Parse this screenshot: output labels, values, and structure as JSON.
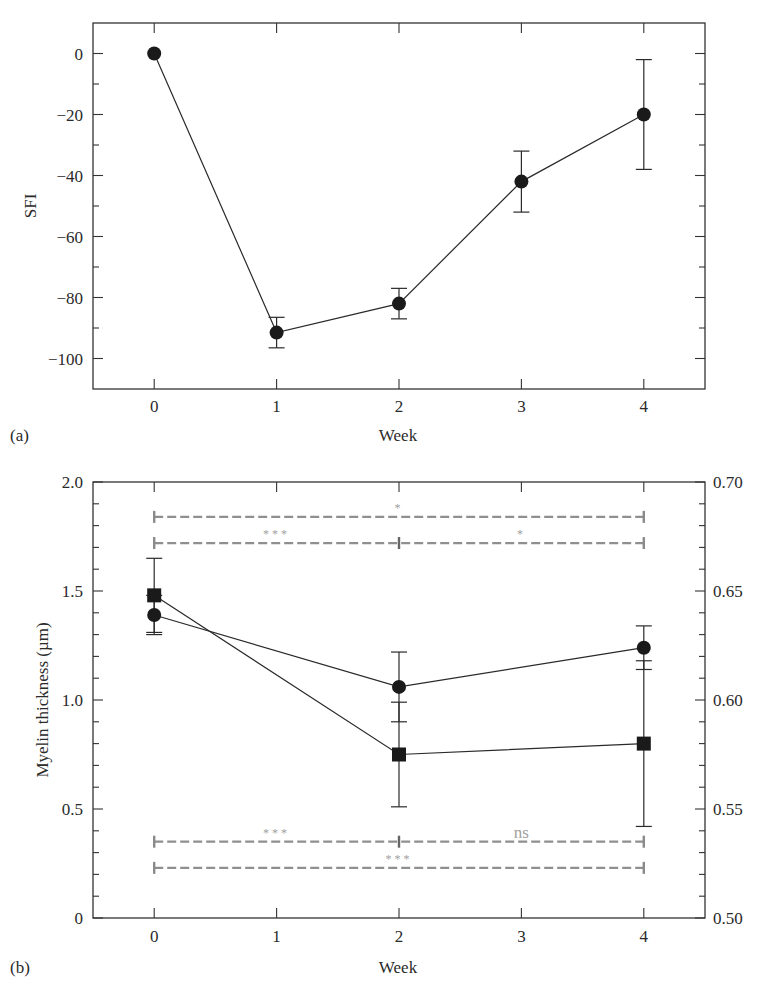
{
  "chart_data": [
    {
      "panel": "(a)",
      "type": "line",
      "title": "",
      "xlabel": "Week",
      "ylabel": "SFI",
      "x": [
        0,
        1,
        2,
        3,
        4
      ],
      "xlim": [
        -0.5,
        4.5
      ],
      "ylim": [
        -110,
        10
      ],
      "xticks": [
        0,
        1,
        2,
        3,
        4
      ],
      "yticks": [
        0,
        -20,
        -40,
        -60,
        -80,
        -100
      ],
      "grid": false,
      "legend": null,
      "series": [
        {
          "name": "SFI",
          "marker": "circle",
          "values": [
            0,
            -91.5,
            -82,
            -42,
            -20
          ],
          "error": [
            0,
            5,
            5,
            10,
            18
          ]
        }
      ]
    },
    {
      "panel": "(b)",
      "type": "line",
      "title": "",
      "xlabel": "Week",
      "ylabel": "Myelin thickness (µm)",
      "ylabel_right": "",
      "x": [
        0,
        2,
        4
      ],
      "xlim": [
        -0.5,
        4.5
      ],
      "ylim": [
        0,
        2.0
      ],
      "ylim_right": [
        0.5,
        0.7
      ],
      "xticks": [
        0,
        1,
        2,
        3,
        4
      ],
      "yticks": [
        "0",
        "0.5",
        "1.0",
        "1.5",
        "2.0"
      ],
      "yticks_right": [
        "0.50",
        "0.55",
        "0.60",
        "0.65",
        "0.70"
      ],
      "grid": false,
      "legend": null,
      "series": [
        {
          "name": "Myelin thickness",
          "marker": "circle",
          "axis": "left",
          "values": [
            1.39,
            1.06,
            1.24
          ],
          "error": [
            0.09,
            0.16,
            0.1
          ]
        },
        {
          "name": "Right-axis series",
          "marker": "square",
          "axis": "right",
          "values": [
            0.648,
            0.575,
            0.58
          ],
          "error": [
            0.017,
            0.024,
            0.038
          ]
        }
      ],
      "annotations": [
        {
          "type": "bracket",
          "from": 0,
          "to": 4,
          "y_left": 1.84,
          "mid_tick": null,
          "labels": [
            {
              "x": 2,
              "text": "*"
            }
          ]
        },
        {
          "type": "bracket",
          "from": 0,
          "to": 4,
          "y_left": 1.72,
          "mid_tick": 2,
          "labels": [
            {
              "x": 1,
              "text": "***"
            },
            {
              "x": 3,
              "text": "*"
            }
          ]
        },
        {
          "type": "bracket",
          "from": 0,
          "to": 4,
          "y_left": 0.35,
          "mid_tick": 2,
          "labels": [
            {
              "x": 1,
              "text": "***"
            },
            {
              "x": 3,
              "text": "ns"
            }
          ]
        },
        {
          "type": "bracket",
          "from": 0,
          "to": 4,
          "y_left": 0.23,
          "mid_tick": null,
          "labels": [
            {
              "x": 2,
              "text": "***"
            }
          ]
        }
      ]
    }
  ],
  "panel_labels": {
    "a": "(a)",
    "b": "(b)"
  },
  "colors": {
    "axis": "#333333",
    "series": "#2a2a2a",
    "significance": "#8f8f8f",
    "significance_text": "#a0a0a0"
  }
}
